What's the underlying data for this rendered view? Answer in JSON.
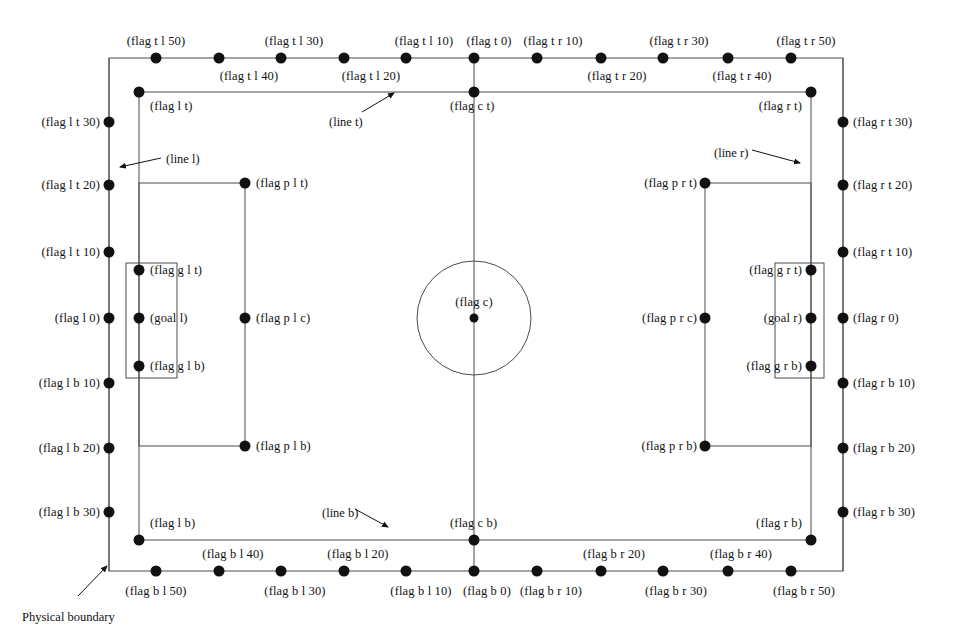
{
  "figure": {
    "physical_boundary_caption": "Physical boundary",
    "line_labels": {
      "line_t": "(line t)",
      "line_b": "(line b)",
      "line_l": "(line l)",
      "line_r": "(line r)"
    },
    "colors": {
      "line": "#4a4a4a",
      "dot": "#111111",
      "text": "#111111",
      "background": "#ffffff"
    }
  },
  "geometry": {
    "boundary": {
      "x": 109,
      "y": 58,
      "w": 734,
      "h": 513
    },
    "field": {
      "x": 139,
      "y": 92,
      "w": 672,
      "h": 448
    },
    "center_line_x": 474,
    "center_circle": {
      "cx": 474,
      "cy": 318,
      "r": 57
    },
    "penalty_box_left": {
      "x": 139,
      "y": 183,
      "w": 106,
      "h": 263
    },
    "penalty_box_right": {
      "x": 705,
      "y": 183,
      "w": 106,
      "h": 263
    },
    "goal_box_left": {
      "x": 126,
      "y": 263,
      "w": 51,
      "h": 115
    },
    "goal_box_right": {
      "x": 775,
      "y": 263,
      "w": 49,
      "h": 115
    }
  },
  "flags": [
    {
      "id": "flag-t-l-50",
      "label": "(flag t l 50)",
      "x": 156,
      "y": 58,
      "text_x": 156,
      "text_y": 41,
      "anchor": "c"
    },
    {
      "id": "flag-t-l-40",
      "label": "(flag t l 40)",
      "x": 219,
      "y": 58,
      "text_x": 249,
      "text_y": 76,
      "anchor": "c"
    },
    {
      "id": "flag-t-l-30",
      "label": "(flag t l 30)",
      "x": 281,
      "y": 58,
      "text_x": 294,
      "text_y": 41,
      "anchor": "c"
    },
    {
      "id": "flag-t-l-20",
      "label": "(flag t l 20)",
      "x": 344,
      "y": 58,
      "text_x": 371,
      "text_y": 76,
      "anchor": "c"
    },
    {
      "id": "flag-t-l-10",
      "label": "(flag t l 10)",
      "x": 406,
      "y": 58,
      "text_x": 424,
      "text_y": 41,
      "anchor": "c"
    },
    {
      "id": "flag-t-0",
      "label": "(flag t 0)",
      "x": 474,
      "y": 58,
      "text_x": 489,
      "text_y": 41,
      "anchor": "c"
    },
    {
      "id": "flag-t-r-10",
      "label": "(flag t r 10)",
      "x": 537,
      "y": 58,
      "text_x": 553,
      "text_y": 41,
      "anchor": "c"
    },
    {
      "id": "flag-t-r-20",
      "label": "(flag t r 20)",
      "x": 601,
      "y": 58,
      "text_x": 617,
      "text_y": 76,
      "anchor": "c"
    },
    {
      "id": "flag-t-r-30",
      "label": "(flag t r 30)",
      "x": 663,
      "y": 58,
      "text_x": 679,
      "text_y": 41,
      "anchor": "c"
    },
    {
      "id": "flag-t-r-40",
      "label": "(flag t r 40)",
      "x": 728,
      "y": 58,
      "text_x": 742,
      "text_y": 76,
      "anchor": "c"
    },
    {
      "id": "flag-t-r-50",
      "label": "(flag t r 50)",
      "x": 791,
      "y": 58,
      "text_x": 806,
      "text_y": 41,
      "anchor": "c"
    },
    {
      "id": "flag-b-l-50",
      "label": "(flag b l 50)",
      "x": 156,
      "y": 571,
      "text_x": 156,
      "text_y": 591,
      "anchor": "c"
    },
    {
      "id": "flag-b-l-40",
      "label": "(flag b l 40)",
      "x": 219,
      "y": 571,
      "text_x": 233,
      "text_y": 554,
      "anchor": "c"
    },
    {
      "id": "flag-b-l-30",
      "label": "(flag b l 30)",
      "x": 281,
      "y": 571,
      "text_x": 295,
      "text_y": 591,
      "anchor": "c"
    },
    {
      "id": "flag-b-l-20",
      "label": "(flag b l 20)",
      "x": 344,
      "y": 571,
      "text_x": 358,
      "text_y": 554,
      "anchor": "c"
    },
    {
      "id": "flag-b-l-10",
      "label": "(flag b l 10)",
      "x": 406,
      "y": 571,
      "text_x": 421,
      "text_y": 591,
      "anchor": "c"
    },
    {
      "id": "flag-b-0",
      "label": "(flag b 0)",
      "x": 474,
      "y": 571,
      "text_x": 487,
      "text_y": 591,
      "anchor": "c"
    },
    {
      "id": "flag-b-r-10",
      "label": "(flag b r 10)",
      "x": 537,
      "y": 571,
      "text_x": 551,
      "text_y": 591,
      "anchor": "c"
    },
    {
      "id": "flag-b-r-20",
      "label": "(flag b r 20)",
      "x": 601,
      "y": 571,
      "text_x": 614,
      "text_y": 554,
      "anchor": "c"
    },
    {
      "id": "flag-b-r-30",
      "label": "(flag b r 30)",
      "x": 663,
      "y": 571,
      "text_x": 676,
      "text_y": 591,
      "anchor": "c"
    },
    {
      "id": "flag-b-r-40",
      "label": "(flag b r 40)",
      "x": 728,
      "y": 571,
      "text_x": 741,
      "text_y": 554,
      "anchor": "c"
    },
    {
      "id": "flag-b-r-50",
      "label": "(flag b r 50)",
      "x": 791,
      "y": 571,
      "text_x": 804,
      "text_y": 591,
      "anchor": "c"
    },
    {
      "id": "flag-l-t-30",
      "label": "(flag l t 30)",
      "x": 109,
      "y": 122,
      "text_x": 100,
      "text_y": 122,
      "anchor": "r"
    },
    {
      "id": "flag-l-t-20",
      "label": "(flag l t 20)",
      "x": 109,
      "y": 185,
      "text_x": 100,
      "text_y": 185,
      "anchor": "r"
    },
    {
      "id": "flag-l-t-10",
      "label": "(flag l t 10)",
      "x": 109,
      "y": 252,
      "text_x": 100,
      "text_y": 252,
      "anchor": "r"
    },
    {
      "id": "flag-l-0",
      "label": "(flag l 0)",
      "x": 109,
      "y": 318,
      "text_x": 100,
      "text_y": 318,
      "anchor": "r"
    },
    {
      "id": "flag-l-b-10",
      "label": "(flag l b 10)",
      "x": 109,
      "y": 383,
      "text_x": 100,
      "text_y": 383,
      "anchor": "r"
    },
    {
      "id": "flag-l-b-20",
      "label": "(flag l b 20)",
      "x": 109,
      "y": 448,
      "text_x": 100,
      "text_y": 448,
      "anchor": "r"
    },
    {
      "id": "flag-l-b-30",
      "label": "(flag l b 30)",
      "x": 109,
      "y": 512,
      "text_x": 100,
      "text_y": 512,
      "anchor": "r"
    },
    {
      "id": "flag-r-t-30",
      "label": "(flag r t 30)",
      "x": 843,
      "y": 122,
      "text_x": 853,
      "text_y": 122,
      "anchor": "l"
    },
    {
      "id": "flag-r-t-20",
      "label": "(flag r t 20)",
      "x": 843,
      "y": 185,
      "text_x": 853,
      "text_y": 185,
      "anchor": "l"
    },
    {
      "id": "flag-r-t-10",
      "label": "(flag r t 10)",
      "x": 843,
      "y": 252,
      "text_x": 853,
      "text_y": 252,
      "anchor": "l"
    },
    {
      "id": "flag-r-0",
      "label": "(flag r 0)",
      "x": 843,
      "y": 318,
      "text_x": 853,
      "text_y": 318,
      "anchor": "l"
    },
    {
      "id": "flag-r-b-10",
      "label": "(flag r b 10)",
      "x": 843,
      "y": 383,
      "text_x": 853,
      "text_y": 383,
      "anchor": "l"
    },
    {
      "id": "flag-r-b-20",
      "label": "(flag r b 20)",
      "x": 843,
      "y": 448,
      "text_x": 853,
      "text_y": 448,
      "anchor": "l"
    },
    {
      "id": "flag-r-b-30",
      "label": "(flag r b 30)",
      "x": 843,
      "y": 512,
      "text_x": 853,
      "text_y": 512,
      "anchor": "l"
    },
    {
      "id": "flag-l-t",
      "label": "(flag l t)",
      "x": 139,
      "y": 92,
      "text_x": 150,
      "text_y": 106,
      "anchor": "l"
    },
    {
      "id": "flag-c-t",
      "label": "(flag c t)",
      "x": 474,
      "y": 92,
      "text_x": 450,
      "text_y": 106,
      "anchor": "l"
    },
    {
      "id": "flag-r-t",
      "label": "(flag r t)",
      "x": 811,
      "y": 92,
      "text_x": 802,
      "text_y": 106,
      "anchor": "r"
    },
    {
      "id": "flag-l-b",
      "label": "(flag l b)",
      "x": 139,
      "y": 540,
      "text_x": 150,
      "text_y": 523,
      "anchor": "l"
    },
    {
      "id": "flag-c-b",
      "label": "(flag c b)",
      "x": 474,
      "y": 540,
      "text_x": 450,
      "text_y": 523,
      "anchor": "l"
    },
    {
      "id": "flag-r-b",
      "label": "(flag r b)",
      "x": 811,
      "y": 540,
      "text_x": 802,
      "text_y": 523,
      "anchor": "r"
    },
    {
      "id": "flag-p-l-t",
      "label": "(flag p l t)",
      "x": 245,
      "y": 183,
      "text_x": 256,
      "text_y": 183,
      "anchor": "l"
    },
    {
      "id": "flag-p-l-c",
      "label": "(flag p l c)",
      "x": 245,
      "y": 318,
      "text_x": 256,
      "text_y": 318,
      "anchor": "l"
    },
    {
      "id": "flag-p-l-b",
      "label": "(flag p l b)",
      "x": 245,
      "y": 446,
      "text_x": 256,
      "text_y": 446,
      "anchor": "l"
    },
    {
      "id": "flag-p-r-t",
      "label": "(flag p r t)",
      "x": 705,
      "y": 183,
      "text_x": 697,
      "text_y": 183,
      "anchor": "r"
    },
    {
      "id": "flag-p-r-c",
      "label": "(flag p r c)",
      "x": 705,
      "y": 318,
      "text_x": 697,
      "text_y": 318,
      "anchor": "r"
    },
    {
      "id": "flag-p-r-b",
      "label": "(flag p r b)",
      "x": 705,
      "y": 446,
      "text_x": 697,
      "text_y": 446,
      "anchor": "r"
    },
    {
      "id": "flag-g-l-t",
      "label": "(flag g l t)",
      "x": 139,
      "y": 270,
      "text_x": 150,
      "text_y": 270,
      "anchor": "l"
    },
    {
      "id": "goal-l",
      "label": "(goal l)",
      "x": 139,
      "y": 318,
      "text_x": 150,
      "text_y": 318,
      "anchor": "l"
    },
    {
      "id": "flag-g-l-b",
      "label": "(flag g l b)",
      "x": 139,
      "y": 366,
      "text_x": 150,
      "text_y": 366,
      "anchor": "l"
    },
    {
      "id": "flag-g-r-t",
      "label": "(flag g r t)",
      "x": 811,
      "y": 270,
      "text_x": 802,
      "text_y": 270,
      "anchor": "r"
    },
    {
      "id": "goal-r",
      "label": "(goal r)",
      "x": 811,
      "y": 318,
      "text_x": 802,
      "text_y": 318,
      "anchor": "r"
    },
    {
      "id": "flag-g-r-b",
      "label": "(flag g r b)",
      "x": 811,
      "y": 366,
      "text_x": 802,
      "text_y": 366,
      "anchor": "r"
    },
    {
      "id": "flag-c",
      "label": "(flag c)",
      "x": 474,
      "y": 318,
      "text_x": 474,
      "text_y": 302,
      "anchor": "c"
    }
  ],
  "annotations": [
    {
      "id": "line-t",
      "label_key": "line_t",
      "text_x": 329,
      "text_y": 115,
      "arrow": {
        "x1": 362,
        "y1": 112,
        "x2": 394,
        "y2": 93
      }
    },
    {
      "id": "line-b",
      "label_key": "line_b",
      "text_x": 322,
      "text_y": 506,
      "arrow": {
        "x1": 355,
        "y1": 509,
        "x2": 388,
        "y2": 527
      }
    },
    {
      "id": "line-l",
      "label_key": "line_l",
      "text_x": 166,
      "text_y": 152,
      "arrow": {
        "x1": 161,
        "y1": 158,
        "x2": 120,
        "y2": 167
      }
    },
    {
      "id": "line-r",
      "label_key": "line_r",
      "text_x": 714,
      "text_y": 146,
      "arrow": {
        "x1": 752,
        "y1": 150,
        "x2": 800,
        "y2": 163
      }
    },
    {
      "id": "physical-boundary",
      "text_x": 22,
      "text_y": 610,
      "arrow": {
        "x1": 78,
        "y1": 596,
        "x2": 107,
        "y2": 566
      }
    }
  ]
}
